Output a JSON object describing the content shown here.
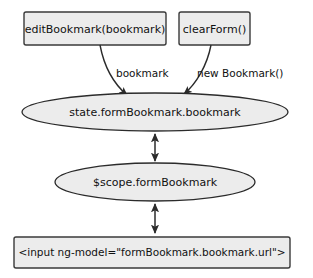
{
  "diagram": {
    "background_color": "#ffffff",
    "node_fill_color": "#ececec",
    "stroke_color": "#2b2b2b",
    "text_color": "#111111",
    "function_boxes": [
      {
        "id": "edit-bookmark",
        "label": "editBookmark(bookmark)",
        "shape": "rectangle"
      },
      {
        "id": "clear-form",
        "label": "clearForm()",
        "shape": "rectangle"
      }
    ],
    "state_nodes": [
      {
        "id": "state-form-bookmark",
        "label": "state.formBookmark.bookmark",
        "shape": "ellipse"
      },
      {
        "id": "scope-form-bookmark",
        "label": "$scope.formBookmark",
        "shape": "ellipse"
      }
    ],
    "template_box": {
      "id": "input-element",
      "label": "<input ng-model=\"formBookmark.bookmark.url\">",
      "shape": "rectangle"
    },
    "edge_labels": [
      {
        "id": "edge-label-bookmark",
        "label": "bookmark",
        "from": "edit-bookmark",
        "to": "state-form-bookmark",
        "arrow": "single"
      },
      {
        "id": "edge-label-new-bookmark",
        "label": "new Bookmark()",
        "from": "clear-form",
        "to": "state-form-bookmark",
        "arrow": "single"
      }
    ],
    "bidirectional_edges": [
      {
        "id": "edge-state-to-scope",
        "from": "state-form-bookmark",
        "to": "scope-form-bookmark",
        "arrow": "double"
      },
      {
        "id": "edge-scope-to-input",
        "from": "scope-form-bookmark",
        "to": "input-element",
        "arrow": "double"
      }
    ]
  }
}
